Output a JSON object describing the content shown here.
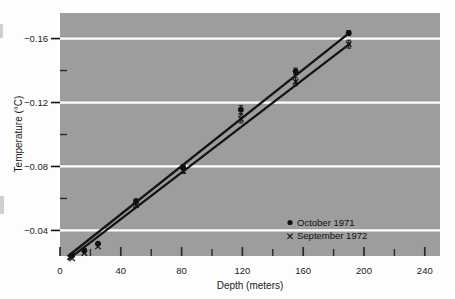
{
  "figure": {
    "background_color": "#fdfdfd",
    "plot_background_color": "#9d9d9d",
    "gridline_color": "#ffffff",
    "ink_color": "#141414"
  },
  "chart_data": {
    "type": "scatter",
    "title": "",
    "subtitle": "",
    "xlabel": "Depth (meters)",
    "ylabel": "Temperature (°C)",
    "xlim": [
      0,
      250
    ],
    "ylim": [
      -0.024,
      -0.176
    ],
    "y_inverted": true,
    "grid": true,
    "grid_axis": "y",
    "legend_position": "lower-right-inside",
    "xticks": [
      0,
      40,
      80,
      120,
      160,
      200,
      240
    ],
    "xtick_labels": [
      "0",
      "40",
      "80",
      "120",
      "160",
      "200",
      "240"
    ],
    "xminor_tick_step": 20,
    "yticks": [
      -0.16,
      -0.12,
      -0.08,
      -0.04
    ],
    "ytick_labels": [
      "−0.16",
      "−0.12",
      "−0.08",
      "−0.04"
    ],
    "yminor_ticks": [
      -0.14,
      -0.1,
      -0.06
    ],
    "series": [
      {
        "name": "October  1971",
        "marker": "filled-circle",
        "color": "#111111",
        "x": [
          8,
          16,
          25,
          50,
          81,
          119,
          155,
          190
        ],
        "y": [
          -0.0245,
          -0.0275,
          -0.0318,
          -0.0585,
          -0.0795,
          -0.1155,
          -0.1395,
          -0.1635
        ],
        "yerr": [
          0.0,
          0.0,
          0.0,
          0.0,
          0.0015,
          0.0025,
          0.002,
          0.0015
        ]
      },
      {
        "name": "September 1972",
        "marker": "cross-x",
        "color": "#111111",
        "x": [
          8,
          16,
          25,
          50,
          81,
          119,
          155,
          190
        ],
        "y": [
          -0.0225,
          -0.0258,
          -0.03,
          -0.0558,
          -0.0772,
          -0.1098,
          -0.133,
          -0.1565
        ],
        "yerr": [
          0.0,
          0.0,
          0.0,
          0.0,
          0.0015,
          0.0025,
          0.0025,
          0.0025
        ]
      }
    ],
    "fit_lines": [
      {
        "series": "October  1971",
        "x0": 5,
        "y0": -0.0237,
        "x1": 191,
        "y1": -0.164
      },
      {
        "series": "September 1972",
        "x0": 5,
        "y0": -0.0216,
        "x1": 191,
        "y1": -0.157
      }
    ]
  },
  "legend": {
    "entries": [
      {
        "marker": "filled-circle",
        "label": "October  1971"
      },
      {
        "marker": "cross-x",
        "label": "September 1972"
      }
    ]
  }
}
